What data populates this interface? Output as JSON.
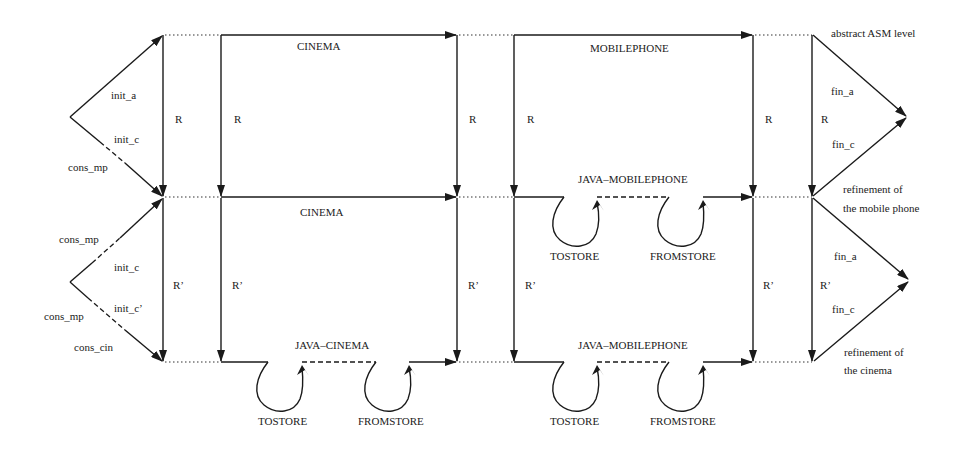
{
  "diagram": {
    "levels": {
      "abstract": "abstract ASM level",
      "mobile_refinement_1": "refinement of",
      "mobile_refinement_2": "the mobile phone",
      "cinema_refinement_1": "refinement of",
      "cinema_refinement_2": "the cinema"
    },
    "machines": {
      "top_cinema": "CINEMA",
      "top_mobilephone": "MOBILEPHONE",
      "mid_cinema": "CINEMA",
      "mid_java_mobilephone": "JAVA–MOBILEPHONE",
      "bot_java_cinema": "JAVA–CINEMA",
      "bot_java_mobilephone": "JAVA–MOBILEPHONE"
    },
    "loops": {
      "tostore": "TOSTORE",
      "fromstore": "FROMSTORE"
    },
    "relations": {
      "R": "R",
      "R_prime": "R’"
    },
    "init_top": {
      "init_a": "init_a",
      "init_c": "init_c",
      "cons_mp": "cons_mp"
    },
    "init_bottom": {
      "cons_mp_upper": "cons_mp",
      "init_c": "init_c",
      "init_c_prime": "init_c’",
      "cons_mp_lower": "cons_mp",
      "cons_cin": "cons_cin"
    },
    "fin_top": {
      "fin_a": "fin_a",
      "fin_c": "fin_c"
    },
    "fin_bottom": {
      "fin_a": "fin_a",
      "fin_c": "fin_c"
    }
  }
}
